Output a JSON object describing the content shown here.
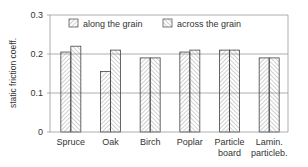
{
  "chart_data": {
    "type": "bar",
    "title": "",
    "xlabel": "",
    "ylabel": "static friction coeff.",
    "ylim": [
      0,
      0.3
    ],
    "yticks": [
      "0",
      "0.1",
      "0.2",
      "0.3"
    ],
    "ytick_values": [
      0,
      0.1,
      0.2,
      0.3
    ],
    "grid": true,
    "legend_position": "top",
    "categories": [
      [
        "Spruce"
      ],
      [
        "Oak"
      ],
      [
        "Birch"
      ],
      [
        "Poplar"
      ],
      [
        "Particle",
        "board"
      ],
      [
        "Lamin.",
        "particleb."
      ]
    ],
    "series": [
      {
        "name": "along the grain",
        "hatch": "forward-diagonal",
        "values": [
          0.205,
          0.155,
          0.19,
          0.205,
          0.21,
          0.19
        ]
      },
      {
        "name": "across the grain",
        "hatch": "back-diagonal",
        "values": [
          0.22,
          0.21,
          0.19,
          0.21,
          0.21,
          0.19
        ]
      }
    ],
    "colors": {
      "bar_stroke": "#444444",
      "hatch": "#888888",
      "grid": "#999999",
      "axis": "#999999"
    }
  }
}
